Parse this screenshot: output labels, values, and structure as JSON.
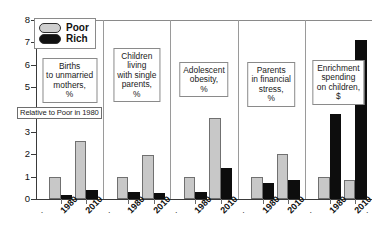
{
  "chart_data": {
    "type": "bar",
    "title": "",
    "subtitle": "",
    "xlabel": "",
    "ylabel": "Relative to Poor in 1980",
    "ylim": [
      0,
      8
    ],
    "yticks": [
      0,
      1,
      2,
      3,
      4,
      5,
      6,
      7,
      8
    ],
    "ytick_labels": [
      "0",
      "1",
      "2",
      "3",
      "4",
      "5",
      "6",
      "7",
      "8"
    ],
    "grid": false,
    "legend_position": "top-left",
    "legend": [
      {
        "name": "Poor",
        "color": "#cfcfcf"
      },
      {
        "name": "Rich",
        "color": "#111111"
      }
    ],
    "categories": [
      "1980",
      "2010"
    ],
    "panels": [
      {
        "title_lines": [
          "Births",
          "to unmarried",
          "mothers,",
          "%"
        ],
        "title": "Births to unmarried mothers, %",
        "series": [
          {
            "name": "Poor",
            "values": [
              1.0,
              2.6
            ]
          },
          {
            "name": "Rich",
            "values": [
              0.2,
              0.42
            ]
          }
        ]
      },
      {
        "title_lines": [
          "Children",
          "living",
          "with single",
          "parents,",
          "%"
        ],
        "title": "Children living with single parents, %",
        "series": [
          {
            "name": "Poor",
            "values": [
              1.0,
              1.95
            ]
          },
          {
            "name": "Rich",
            "values": [
              0.3,
              0.28
            ]
          }
        ]
      },
      {
        "title_lines": [
          "Adolescent",
          "obesity,",
          "%"
        ],
        "title": "Adolescent obesity, %",
        "series": [
          {
            "name": "Poor",
            "values": [
              1.0,
              3.6
            ]
          },
          {
            "name": "Rich",
            "values": [
              0.3,
              1.4
            ]
          }
        ]
      },
      {
        "title_lines": [
          "Parents",
          "in financial",
          "stress,",
          "%"
        ],
        "title": "Parents in financial stress, %",
        "series": [
          {
            "name": "Poor",
            "values": [
              1.0,
              2.0
            ]
          },
          {
            "name": "Rich",
            "values": [
              0.72,
              0.85
            ]
          }
        ]
      },
      {
        "title_lines": [
          "Enrichment",
          "spending",
          "on children,",
          "$"
        ],
        "title": "Enrichment spending on children, $",
        "series": [
          {
            "name": "Poor",
            "values": [
              1.0,
              0.85
            ]
          },
          {
            "name": "Rich",
            "values": [
              3.8,
              7.1
            ]
          }
        ]
      }
    ]
  }
}
